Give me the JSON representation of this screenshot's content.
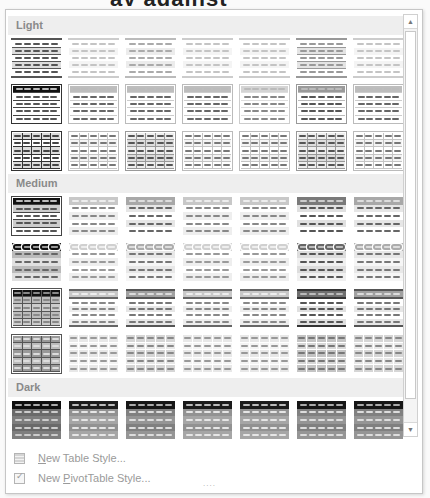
{
  "background_title_fragment": "ay against",
  "gallery": {
    "sections": [
      {
        "label": "Light",
        "rows": [
          [
            "light-banded-dark",
            "light-plain",
            "light-plain-mid",
            "light-plain",
            "light-plain",
            "light-banded-mid",
            "light-plain"
          ],
          [
            "light-header-black",
            "light-header-mid",
            "light-header-mid",
            "light-header-mid",
            "light-header-light",
            "light-header-dark",
            "light-header-mid"
          ],
          [
            "light-grid-dark",
            "light-grid",
            "light-grid-mid",
            "light-grid",
            "light-grid",
            "light-grid-mid",
            "light-grid"
          ]
        ]
      },
      {
        "label": "Medium",
        "rows": [
          [
            "med-black-banded",
            "med-header-light",
            "med-header-mid",
            "med-header-light",
            "med-header-light",
            "med-header-dark",
            "med-header-mid"
          ],
          [
            "med-black-boxed",
            "med-boxed-light",
            "med-boxed-mid",
            "med-boxed-light",
            "med-boxed-light",
            "med-boxed-dark",
            "med-boxed-mid"
          ],
          [
            "med-black-grid",
            "med-heavy-light",
            "med-heavy-mid",
            "med-heavy-light",
            "med-heavy-light",
            "med-heavy-dark",
            "med-heavy-mid"
          ],
          [
            "med-dark-grid",
            "med-fill-light",
            "med-fill-mid",
            "med-fill-light",
            "med-fill-light",
            "med-fill-dark",
            "med-fill-mid"
          ]
        ]
      },
      {
        "label": "Dark",
        "rows": [
          [
            "dark-1",
            "dark-2",
            "dark-3",
            "dark-2",
            "dark-2",
            "dark-3",
            "dark-3"
          ]
        ]
      }
    ]
  },
  "scrollbar": {
    "up_icon": "▲",
    "down_icon": "▼"
  },
  "menu": {
    "new_table_style": {
      "accel": "N",
      "rest": "ew Table Style..."
    },
    "new_pivot_style": {
      "prefix": "New ",
      "accel": "P",
      "rest": "ivotTable Style..."
    }
  },
  "resize_grip": "....",
  "colors": {
    "panel_bg": "#ffffff",
    "section_bg": "#eeeeee",
    "section_text": "#8a8a8a",
    "menu_text": "#9a9a9a"
  }
}
